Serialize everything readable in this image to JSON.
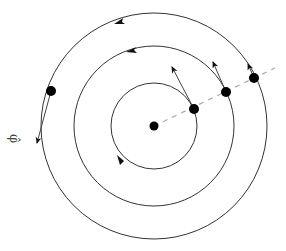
{
  "diagram": {
    "title": "",
    "center": {
      "x": 154,
      "y": 126
    },
    "circles": [
      {
        "name": "inner",
        "r": 43
      },
      {
        "name": "middle",
        "r": 80
      },
      {
        "name": "outer",
        "r": 113
      }
    ],
    "points": [
      {
        "x": 194,
        "y": 109,
        "arrow_to": {
          "x": 171,
          "y": 65
        }
      },
      {
        "x": 226,
        "y": 92,
        "arrow_to": {
          "x": 212,
          "y": 60
        }
      },
      {
        "x": 254,
        "y": 78,
        "arrow_to": {
          "x": 247,
          "y": 62
        }
      },
      {
        "x": 51,
        "y": 91,
        "arrow_to": {
          "x": 36,
          "y": 145
        }
      }
    ],
    "phi_label": "φ̂",
    "colors": {
      "stroke": "#333333",
      "dash": "#aaaaaa"
    }
  }
}
